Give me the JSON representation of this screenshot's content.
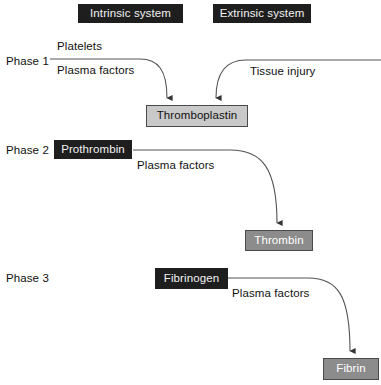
{
  "diagram": {
    "colors": {
      "dark_box": "#1e1e1e",
      "light_box": "#c9c9c9",
      "mid_box": "#8c8c8c",
      "line": "#444444",
      "background": "#ffffff",
      "text_dark": "#111111",
      "text_light": "#f2f2f2"
    },
    "headers": [
      {
        "id": "intrinsic",
        "label": "Intrinsic system"
      },
      {
        "id": "extrinsic",
        "label": "Extrinsic system"
      }
    ],
    "phases": [
      {
        "id": "phase1",
        "label": "Phase 1"
      },
      {
        "id": "phase2",
        "label": "Phase 2"
      },
      {
        "id": "phase3",
        "label": "Phase 3"
      }
    ],
    "nodes": [
      {
        "id": "thromboplastin",
        "label": "Thromboplastin",
        "style": "light"
      },
      {
        "id": "prothrombin",
        "label": "Prothrombin",
        "style": "dark"
      },
      {
        "id": "thrombin",
        "label": "Thrombin",
        "style": "mid"
      },
      {
        "id": "fibrinogen",
        "label": "Fibrinogen",
        "style": "dark"
      },
      {
        "id": "fibrin",
        "label": "Fibrin",
        "style": "mid"
      }
    ],
    "edge_labels": [
      {
        "id": "platelets",
        "label": "Platelets"
      },
      {
        "id": "plasma_factors_1",
        "label": "Plasma factors"
      },
      {
        "id": "tissue_injury",
        "label": "Tissue injury"
      },
      {
        "id": "plasma_factors_2",
        "label": "Plasma factors"
      },
      {
        "id": "plasma_factors_3",
        "label": "Plasma factors"
      }
    ],
    "flows": [
      {
        "from": "intrinsic pathway (platelets + plasma factors)",
        "to": "thromboplastin"
      },
      {
        "from": "extrinsic pathway (tissue injury)",
        "to": "thromboplastin"
      },
      {
        "from": "prothrombin",
        "to": "thrombin"
      },
      {
        "from": "fibrinogen",
        "to": "fibrin"
      }
    ]
  }
}
